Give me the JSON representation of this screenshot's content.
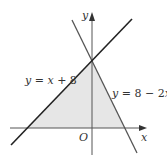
{
  "diagram": {
    "type": "linear inequalities region",
    "axes": {
      "x_label": "x",
      "y_label": "y",
      "origin_label": "O"
    },
    "lines": [
      {
        "name": "line-1",
        "equation": "y = x + 8",
        "color": "#222222"
      },
      {
        "name": "line-2",
        "equation": "y = 8 − 2x",
        "color": "#555555"
      }
    ],
    "shaded_region": {
      "description": "triangle bounded by y = x + 8, y = 8 − 2x and the x-axis",
      "vertices": [
        [
          -8,
          0
        ],
        [
          0,
          8
        ],
        [
          4,
          0
        ]
      ],
      "fill": "#e6e6e6"
    }
  },
  "labels": {
    "line1_text_y": "y",
    "line1_text_rest": " = ",
    "line1_text_x": "x",
    "line1_text_end": " + 8",
    "line2_text_y": "y",
    "line2_text_rest": " = 8 − 2",
    "line2_text_x": "x",
    "x_axis": "x",
    "y_axis": "y",
    "origin": "O"
  }
}
